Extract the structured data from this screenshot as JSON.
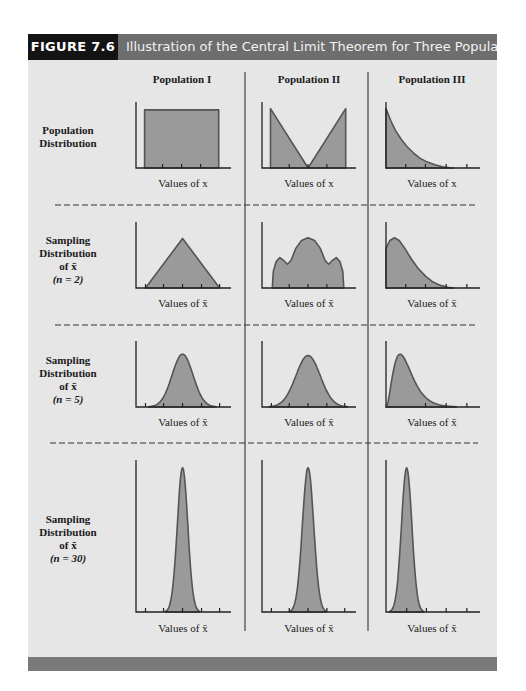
{
  "figure": {
    "number_label": "FIGURE 7.6",
    "title": "Illustration of the Central Limit Theorem for Three Populations"
  },
  "colors": {
    "header_label_bg": "#141414",
    "header_title_bg": "#6e6e6e",
    "panel_bg": "#e6e6e6",
    "footer_bar": "#7a7a7a",
    "curve_fill": "#9a9a9a",
    "curve_stroke": "#555555",
    "axis": "#222222"
  },
  "columns": [
    {
      "heading": "Population I"
    },
    {
      "heading": "Population II"
    },
    {
      "heading": "Population III"
    }
  ],
  "rows": [
    {
      "label_lines": [
        "Population",
        "Distribution"
      ],
      "axis_label": "Values of x"
    },
    {
      "label_lines": [
        "Sampling",
        "Distribution",
        "of x̄",
        "(n = 2)"
      ],
      "axis_label": "Values of x̄"
    },
    {
      "label_lines": [
        "Sampling",
        "Distribution",
        "of x̄",
        "(n = 5)"
      ],
      "axis_label": "Values of x̄"
    },
    {
      "label_lines": [
        "Sampling",
        "Distribution",
        "of x̄",
        "(n = 30)"
      ],
      "axis_label": "Values of x̄"
    }
  ],
  "chart_data": {
    "type": "area",
    "title": "Illustration of the Central Limit Theorem for Three Populations",
    "layout": "3 columns (populations) x 4 rows (population distribution, n=2, n=5, n=30)",
    "xlabel_population": "Values of x",
    "xlabel_sampling": "Values of x̄",
    "ylabel": "",
    "grid": false,
    "panels": [
      {
        "column": "Population I",
        "row": "Population Distribution",
        "shape": "uniform",
        "points": [
          [
            0.09,
            0
          ],
          [
            0.09,
            0.88
          ],
          [
            0.87,
            0.88
          ],
          [
            0.87,
            0
          ]
        ],
        "ticks": [
          0.28,
          0.48,
          0.68
        ]
      },
      {
        "column": "Population II",
        "row": "Population Distribution",
        "shape": "V-shaped (bimodal at extremes)",
        "points": [
          [
            0.09,
            0
          ],
          [
            0.09,
            0.9
          ],
          [
            0.49,
            0
          ],
          [
            0.89,
            0.9
          ],
          [
            0.89,
            0
          ]
        ],
        "ticks": [
          0.29,
          0.49,
          0.69
        ]
      },
      {
        "column": "Population III",
        "row": "Population Distribution",
        "shape": "exponential (right-skewed)",
        "points": [
          [
            0,
            0
          ],
          [
            0,
            0.9
          ],
          [
            0.05,
            0.72
          ],
          [
            0.1,
            0.57
          ],
          [
            0.16,
            0.44
          ],
          [
            0.22,
            0.33
          ],
          [
            0.29,
            0.23
          ],
          [
            0.36,
            0.15
          ],
          [
            0.44,
            0.09
          ],
          [
            0.52,
            0.05
          ],
          [
            0.6,
            0.02
          ],
          [
            0.68,
            0.005
          ],
          [
            0.72,
            0
          ]
        ],
        "ticks": [
          0.21,
          0.42,
          0.64,
          0.86
        ]
      },
      {
        "column": "Population I",
        "row": "Sampling Distribution (n = 2)",
        "shape": "triangular",
        "points": [
          [
            0.1,
            0
          ],
          [
            0.49,
            0.75
          ],
          [
            0.88,
            0
          ]
        ],
        "ticks": [
          0.1,
          0.29,
          0.49,
          0.69,
          0.88
        ]
      },
      {
        "column": "Population II",
        "row": "Sampling Distribution (n = 2)",
        "shape": "trimodal",
        "points": [
          [
            0.11,
            0
          ],
          [
            0.12,
            0.25
          ],
          [
            0.15,
            0.4
          ],
          [
            0.19,
            0.46
          ],
          [
            0.23,
            0.42
          ],
          [
            0.27,
            0.36
          ],
          [
            0.31,
            0.42
          ],
          [
            0.36,
            0.6
          ],
          [
            0.42,
            0.72
          ],
          [
            0.49,
            0.76
          ],
          [
            0.56,
            0.72
          ],
          [
            0.62,
            0.6
          ],
          [
            0.67,
            0.42
          ],
          [
            0.71,
            0.36
          ],
          [
            0.75,
            0.42
          ],
          [
            0.79,
            0.46
          ],
          [
            0.83,
            0.4
          ],
          [
            0.86,
            0.25
          ],
          [
            0.87,
            0
          ]
        ],
        "ticks": [
          0.29,
          0.49,
          0.69
        ]
      },
      {
        "column": "Population III",
        "row": "Sampling Distribution (n = 2)",
        "shape": "right-skewed",
        "points": [
          [
            0,
            0
          ],
          [
            0,
            0.6
          ],
          [
            0.04,
            0.72
          ],
          [
            0.09,
            0.76
          ],
          [
            0.14,
            0.72
          ],
          [
            0.2,
            0.6
          ],
          [
            0.27,
            0.44
          ],
          [
            0.34,
            0.3
          ],
          [
            0.42,
            0.18
          ],
          [
            0.5,
            0.09
          ],
          [
            0.58,
            0.04
          ],
          [
            0.66,
            0.01
          ],
          [
            0.72,
            0
          ]
        ],
        "ticks": [
          0.21,
          0.42,
          0.64,
          0.86
        ]
      },
      {
        "column": "Population I",
        "row": "Sampling Distribution (n = 5)",
        "shape": "approximately normal",
        "points": "normal(mu=0.49, sigma=0.11, peak=0.8)",
        "ticks": [
          0.1,
          0.29,
          0.49,
          0.69,
          0.88
        ]
      },
      {
        "column": "Population II",
        "row": "Sampling Distribution (n = 5)",
        "shape": "approximately normal",
        "points": "normal(mu=0.49, sigma=0.13, peak=0.78)",
        "ticks": [
          0.1,
          0.29,
          0.49,
          0.69,
          0.88
        ]
      },
      {
        "column": "Population III",
        "row": "Sampling Distribution (n = 5)",
        "shape": "right-skewed, more peaked",
        "points": "skewed(mode=0.15, peak=0.8)",
        "ticks": [
          0.42,
          0.64,
          0.86
        ]
      },
      {
        "column": "Population I",
        "row": "Sampling Distribution (n = 30)",
        "shape": "normal, narrow",
        "points": "normal(mu=0.49, sigma=0.055, peak=0.95)",
        "ticks": [
          0.1,
          0.29,
          0.49,
          0.69,
          0.88
        ]
      },
      {
        "column": "Population II",
        "row": "Sampling Distribution (n = 30)",
        "shape": "normal, narrow",
        "points": "normal(mu=0.49, sigma=0.06, peak=0.95)",
        "ticks": [
          0.1,
          0.29,
          0.49,
          0.69,
          0.88
        ]
      },
      {
        "column": "Population III",
        "row": "Sampling Distribution (n = 30)",
        "shape": "normal, narrow (slightly skewed)",
        "points": "normal(mu=0.22, sigma=0.055, peak=0.95)",
        "ticks": [
          0.22,
          0.43,
          0.64,
          0.86
        ]
      }
    ]
  }
}
